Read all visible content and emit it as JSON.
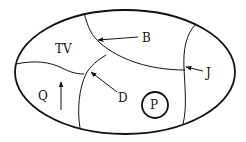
{
  "diagram": {
    "type": "map-regions",
    "labels": {
      "tv": "TV",
      "b": "B",
      "j": "J",
      "d": "D",
      "q": "Q",
      "p": "P"
    },
    "regions": [
      {
        "id": "TV",
        "description": "upper-left region"
      },
      {
        "id": "Q",
        "description": "lower-left region with upward arrow"
      },
      {
        "id": "P",
        "description": "circle in lower-middle region"
      }
    ],
    "pointers": [
      {
        "label": "B",
        "target": "curved boundary between top region and TV"
      },
      {
        "label": "J",
        "target": "right vertical boundary"
      },
      {
        "label": "D",
        "target": "junction of left boundaries"
      }
    ],
    "colors": {
      "stroke": "#111111",
      "background": "#ffffff"
    }
  }
}
